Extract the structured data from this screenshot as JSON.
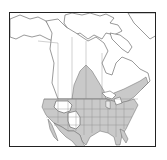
{
  "map": {
    "title": "",
    "region": "North America",
    "description": "Species range map; shaded area indicates distribution",
    "legend": [],
    "colors": {
      "range_fill": "#c9c9c9",
      "land_fill": "#ffffff",
      "outline": "#555555",
      "frame": "#222222"
    },
    "shaded_regions": [
      "Contiguous United States (except parts of interior West)",
      "Southern Canadian Prairies",
      "Southern Ontario and Quebec",
      "Maritime Provinces",
      "Mexico (coasts and central plateau)"
    ],
    "unshaded_regions": [
      "Alaska",
      "Northern Canada",
      "Arctic islands",
      "Greenland",
      "Parts of Idaho, Montana, Wyoming, Utah, Colorado"
    ]
  }
}
